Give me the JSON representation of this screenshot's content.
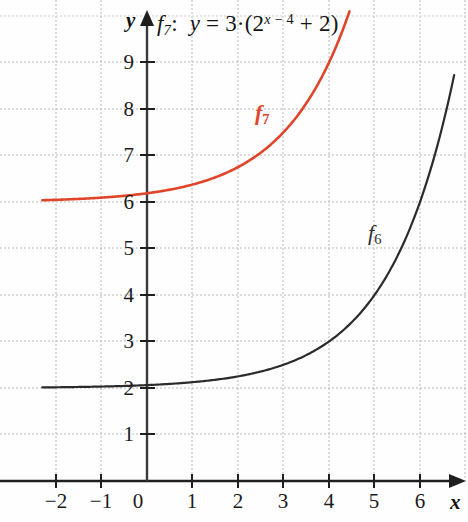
{
  "chart_data": {
    "type": "line",
    "title_parts": {
      "fname": "f",
      "fsub": "7",
      "colon": ":",
      "y": "y",
      "equals": "=",
      "coef": "3",
      "dot": "·",
      "open": "(",
      "base": "2",
      "exponent": "x − 4",
      "plus": "+",
      "inner": "2",
      "close": ")"
    },
    "xlabel": "x",
    "ylabel": "y",
    "xlim": [
      -2.3,
      6.8
    ],
    "ylim": [
      -0.45,
      10.1
    ],
    "xticks": [
      -2,
      -1,
      0,
      1,
      2,
      3,
      4,
      5,
      6
    ],
    "xtick_labels": [
      "−2",
      "−1",
      "0",
      "1",
      "2",
      "3",
      "4",
      "5",
      "6"
    ],
    "yticks": [
      1,
      2,
      3,
      4,
      5,
      6,
      7,
      8,
      9
    ],
    "ytick_labels": [
      "1",
      "2",
      "3",
      "4",
      "5",
      "6",
      "7",
      "8",
      "9"
    ],
    "grid": true,
    "grid_style": "dotted",
    "grid_color": "#b4b4b4",
    "axis_color": "#1f1f1f",
    "legend_position": "inline-annotations",
    "series": [
      {
        "name": "f₆",
        "label": "f",
        "label_sub": "6",
        "expression": "y = 2^(x-4) + 2",
        "color": "#2b2b2b",
        "asymptote": 2,
        "points": [
          {
            "x": -2.3,
            "y": 2.02
          },
          {
            "x": -2.0,
            "y": 2.02
          },
          {
            "x": -1.0,
            "y": 2.04
          },
          {
            "x": 0.0,
            "y": 2.06
          },
          {
            "x": 1.0,
            "y": 2.13
          },
          {
            "x": 2.0,
            "y": 2.25
          },
          {
            "x": 3.0,
            "y": 2.5
          },
          {
            "x": 3.5,
            "y": 2.71
          },
          {
            "x": 4.0,
            "y": 3.0
          },
          {
            "x": 4.5,
            "y": 3.41
          },
          {
            "x": 5.0,
            "y": 4.0
          },
          {
            "x": 5.5,
            "y": 4.83
          },
          {
            "x": 6.0,
            "y": 6.0
          },
          {
            "x": 6.4,
            "y": 7.28
          },
          {
            "x": 6.75,
            "y": 8.73
          }
        ]
      },
      {
        "name": "f₇",
        "label": "f",
        "label_sub": "7",
        "expression": "y = 3·(2^(x-4) + 2)",
        "color": "#e0452b",
        "asymptote": 6,
        "points": [
          {
            "x": -2.3,
            "y": 6.05
          },
          {
            "x": -2.0,
            "y": 6.06
          },
          {
            "x": -1.0,
            "y": 6.12
          },
          {
            "x": 0.0,
            "y": 6.19
          },
          {
            "x": 1.0,
            "y": 6.38
          },
          {
            "x": 2.0,
            "y": 6.75
          },
          {
            "x": 2.5,
            "y": 7.06
          },
          {
            "x": 3.0,
            "y": 7.5
          },
          {
            "x": 3.5,
            "y": 8.12
          },
          {
            "x": 4.0,
            "y": 9.0
          },
          {
            "x": 4.35,
            "y": 9.82
          },
          {
            "x": 4.45,
            "y": 10.1
          }
        ]
      }
    ]
  }
}
